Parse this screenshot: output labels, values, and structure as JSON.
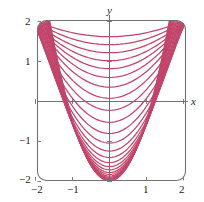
{
  "figure": {
    "background_color": "#ffffff",
    "frame_color": "#6f7176",
    "axis_color": "#6f7176",
    "curve_color": "#c2456b",
    "label_color": "#231f20"
  },
  "axes": {
    "x_name": "x",
    "y_name": "y",
    "x_ticks": [
      {
        "label": "−2",
        "value": -2
      },
      {
        "label": "−1",
        "value": -1
      },
      {
        "label": "1",
        "value": 1
      },
      {
        "label": "2",
        "value": 2
      }
    ],
    "y_ticks": [
      {
        "label": "2",
        "value": 2
      },
      {
        "label": "1",
        "value": 1
      },
      {
        "label": "−1",
        "value": -1
      },
      {
        "label": "−2",
        "value": -2
      }
    ]
  },
  "chart_data": {
    "type": "line",
    "title": "",
    "subtitle": "",
    "xlabel": "x",
    "ylabel": "y",
    "xlim": [
      -2,
      2
    ],
    "ylim": [
      -2,
      2
    ],
    "grid": false,
    "legend": "none",
    "curve_color": "#c2456b",
    "curve_count": 26,
    "x_samples": [
      -2,
      -1.75,
      -1.5,
      -1.25,
      -1,
      -0.75,
      -0.5,
      -0.25,
      0,
      0.25,
      0.5,
      0.75,
      1,
      1.25,
      1.5,
      1.75,
      2
    ],
    "series": [
      {
        "name": "level-1",
        "vertex_y": 1.62,
        "curvature": 0.1
      },
      {
        "name": "level-2",
        "vertex_y": 1.42,
        "curvature": 0.145
      },
      {
        "name": "level-3",
        "vertex_y": 1.22,
        "curvature": 0.19
      },
      {
        "name": "level-4",
        "vertex_y": 1.02,
        "curvature": 0.235
      },
      {
        "name": "level-5",
        "vertex_y": 0.82,
        "curvature": 0.285
      },
      {
        "name": "level-6",
        "vertex_y": 0.6,
        "curvature": 0.335
      },
      {
        "name": "level-7",
        "vertex_y": 0.36,
        "curvature": 0.39
      },
      {
        "name": "level-8",
        "vertex_y": 0.08,
        "curvature": 0.45
      },
      {
        "name": "level-9",
        "vertex_y": -0.22,
        "curvature": 0.52
      },
      {
        "name": "level-10",
        "vertex_y": -0.52,
        "curvature": 0.6
      },
      {
        "name": "level-11",
        "vertex_y": -0.8,
        "curvature": 0.68
      },
      {
        "name": "level-12",
        "vertex_y": -1.04,
        "curvature": 0.76
      },
      {
        "name": "level-13",
        "vertex_y": -1.24,
        "curvature": 0.84
      },
      {
        "name": "level-14",
        "vertex_y": -1.4,
        "curvature": 0.92
      },
      {
        "name": "level-15",
        "vertex_y": -1.53,
        "curvature": 1.0
      },
      {
        "name": "level-16",
        "vertex_y": -1.63,
        "curvature": 1.07
      },
      {
        "name": "level-17",
        "vertex_y": -1.71,
        "curvature": 1.14
      },
      {
        "name": "level-18",
        "vertex_y": -1.775,
        "curvature": 1.2
      },
      {
        "name": "level-19",
        "vertex_y": -1.825,
        "curvature": 1.26
      },
      {
        "name": "level-20",
        "vertex_y": -1.866,
        "curvature": 1.31
      },
      {
        "name": "level-21",
        "vertex_y": -1.899,
        "curvature": 1.36
      },
      {
        "name": "level-22",
        "vertex_y": -1.925,
        "curvature": 1.4
      },
      {
        "name": "level-23",
        "vertex_y": -1.946,
        "curvature": 1.44
      },
      {
        "name": "level-24",
        "vertex_y": -1.962,
        "curvature": 1.47
      },
      {
        "name": "level-25",
        "vertex_y": -1.975,
        "curvature": 1.5
      },
      {
        "name": "level-26",
        "vertex_y": -1.985,
        "curvature": 1.53
      }
    ]
  }
}
